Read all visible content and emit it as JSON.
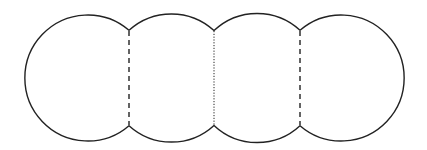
{
  "diagram": {
    "stroke_color": "#222222",
    "background": "#ffffff",
    "circles": [
      {
        "cx": 87,
        "cy": 78,
        "r": 63
      },
      {
        "cx": 171,
        "cy": 78,
        "r": 63
      },
      {
        "cx": 257,
        "cy": 78,
        "r": 63
      },
      {
        "cx": 343,
        "cy": 78,
        "r": 63
      }
    ],
    "dividers": [
      {
        "x": 129,
        "style": "dashed"
      },
      {
        "x": 214,
        "style": "dotted"
      },
      {
        "x": 300,
        "style": "dashed"
      }
    ]
  }
}
